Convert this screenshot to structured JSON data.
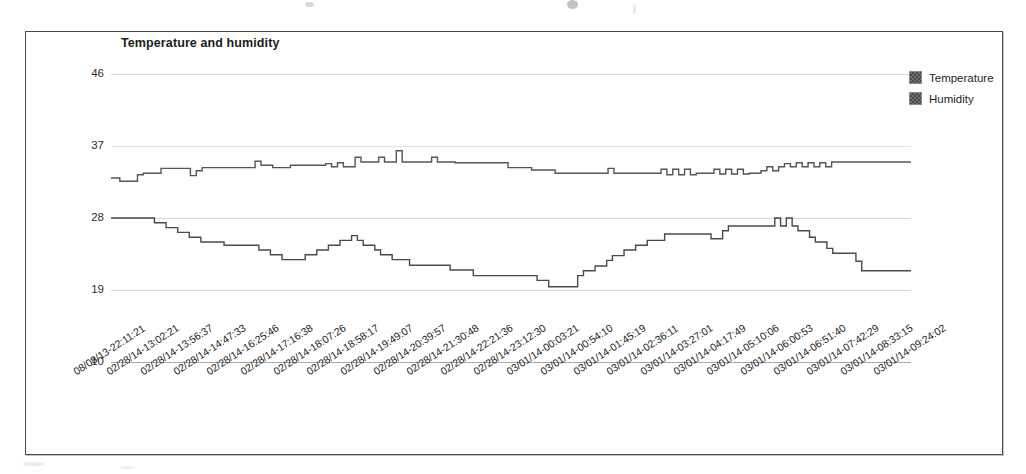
{
  "chart_data": {
    "type": "line",
    "title": "Temperature and humidity",
    "xlabel": "",
    "ylabel": "",
    "ylim": [
      10,
      46
    ],
    "yticks": [
      10,
      19,
      28,
      37,
      46
    ],
    "grid": true,
    "legend_position": "right",
    "x_tick_labels": [
      "08/08/13-22:11:21",
      "02/28/14-13:02:21",
      "02/28/14-13:56:37",
      "02/28/14-14:47:33",
      "02/28/14-16:25:46",
      "02/28/14-17:16:38",
      "02/28/14-18:07:26",
      "02/28/14-18:58:17",
      "02/28/14-19:49:07",
      "02/28/14-20:39:57",
      "02/28/14-21:30:48",
      "02/28/14-22:21:36",
      "02/28/14-23:12:30",
      "03/01/14-00:03:21",
      "03/01/14-00:54:10",
      "03/01/14-01:45:19",
      "03/01/14-02:36:11",
      "03/01/14-03:27:01",
      "03/01/14-04:17:49",
      "03/01/14-05:10:06",
      "03/01/14-06:00:53",
      "03/01/14-06:51:40",
      "03/01/14-07:42:29",
      "03/01/14-08:33:15",
      "03/01/14-09:24:02"
    ],
    "series": [
      {
        "name": "Temperature",
        "color": "#555555",
        "values": [
          33,
          33,
          32.6,
          32.6,
          32.6,
          33.4,
          33.6,
          33.6,
          33.6,
          34.2,
          34.2,
          34.2,
          34.2,
          34.2,
          33.3,
          33.9,
          34.3,
          34.3,
          34.3,
          34.3,
          34.3,
          34.3,
          34.3,
          34.3,
          34.3,
          35.1,
          34.6,
          34.6,
          34.3,
          34.3,
          34.3,
          34.6,
          34.6,
          34.6,
          34.6,
          34.6,
          34.6,
          34.8,
          34.4,
          34.9,
          34.4,
          34.4,
          35.6,
          35.0,
          35.0,
          35.0,
          35.6,
          35.0,
          35.0,
          36.4,
          35.0,
          35.0,
          35.0,
          35.0,
          35.0,
          35.6,
          35.0,
          35.0,
          35.0,
          34.9,
          34.9,
          34.9,
          34.9,
          34.9,
          34.9,
          34.9,
          34.9,
          34.9,
          34.3,
          34.3,
          34.3,
          34.3,
          34.0,
          34.0,
          34.0,
          34.0,
          33.6,
          33.6,
          33.6,
          33.6,
          33.6,
          33.6,
          33.6,
          33.6,
          33.6,
          34.2,
          33.6,
          33.6,
          33.6,
          33.6,
          33.6,
          33.6,
          33.6,
          33.6,
          34.1,
          33.4,
          34.1,
          33.4,
          34.1,
          33.4,
          33.6,
          33.6,
          33.6,
          34.1,
          33.5,
          34.1,
          33.5,
          34.1,
          33.5,
          33.6,
          33.6,
          33.9,
          34.4,
          33.9,
          34.4,
          34.8,
          34.4,
          34.9,
          34.4,
          34.9,
          34.4,
          34.9,
          34.4,
          35.0,
          35.0,
          35.0,
          35.0,
          35.0,
          35.0,
          35.0,
          35.0,
          35.0,
          35.0,
          35.0,
          35.0,
          35.0,
          35.0
        ]
      },
      {
        "name": "Humidity",
        "color": "#4a4a4a",
        "values": [
          28,
          28,
          28,
          28,
          28,
          28,
          28,
          28,
          27.4,
          27.4,
          26.8,
          26.8,
          26.2,
          26.2,
          25.6,
          25.6,
          25.0,
          25.0,
          25.0,
          25.0,
          24.6,
          24.6,
          24.6,
          24.6,
          24.6,
          24.6,
          24.0,
          24.0,
          23.4,
          23.4,
          22.8,
          22.8,
          22.8,
          22.8,
          23.4,
          23.4,
          24.0,
          24.0,
          24.6,
          24.6,
          25.2,
          25.2,
          25.8,
          25.2,
          24.6,
          24.6,
          24.0,
          23.4,
          23.4,
          22.8,
          22.8,
          22.8,
          22.1,
          22.1,
          22.1,
          22.1,
          22.1,
          22.1,
          22.1,
          21.5,
          21.5,
          21.5,
          21.5,
          20.8,
          20.8,
          20.8,
          20.8,
          20.8,
          20.8,
          20.8,
          20.8,
          20.8,
          20.8,
          20.8,
          20.2,
          20.2,
          19.4,
          19.4,
          19.4,
          19.4,
          19.4,
          20.8,
          21.4,
          21.4,
          22.0,
          22.0,
          22.7,
          23.3,
          23.3,
          24.0,
          24.0,
          24.6,
          24.6,
          25.2,
          25.2,
          25.2,
          26.0,
          26.0,
          26.0,
          26.0,
          26.0,
          26.0,
          26.0,
          26.0,
          25.4,
          25.4,
          26.4,
          27.0,
          27.0,
          27.0,
          27.0,
          27.0,
          27.0,
          27.0,
          27.0,
          28.0,
          27.0,
          28.0,
          27.0,
          26.4,
          26.4,
          25.6,
          25.0,
          25.0,
          24.2,
          23.6,
          23.6,
          23.6,
          23.6,
          22.6,
          21.4,
          21.4,
          21.4,
          21.4,
          21.4,
          21.4,
          21.4,
          21.4,
          21.4
        ]
      }
    ]
  },
  "legend": {
    "items": [
      {
        "label": "Temperature"
      },
      {
        "label": "Humidity"
      }
    ]
  }
}
